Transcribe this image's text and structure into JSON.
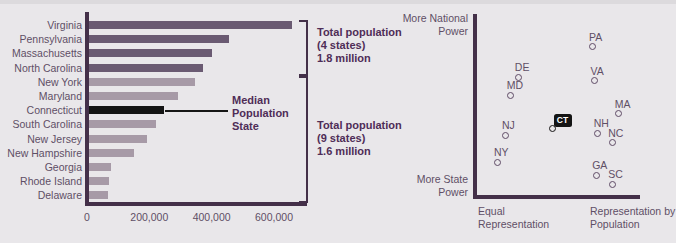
{
  "colors": {
    "background": "#e9e7ea",
    "axis": "#443049",
    "bar_dark": "#6a5a72",
    "bar_light": "#a79aa7",
    "highlight_black": "#141414",
    "label_text": "#5f4f66",
    "annotation_text": "#4f2d57"
  },
  "chart_data": [
    {
      "type": "bar",
      "title": "",
      "xlabel": "",
      "ylabel": "",
      "categories": [
        "Virginia",
        "Pennsylvania",
        "Massachusetts",
        "North Carolina",
        "New York",
        "Maryland",
        "Connecticut",
        "South Carolina",
        "New Jersey",
        "New Hampshire",
        "Georgia",
        "Rhode Island",
        "Delaware"
      ],
      "values": [
        650000,
        450000,
        395000,
        365000,
        340000,
        285000,
        240000,
        215000,
        185000,
        145000,
        70000,
        65000,
        60000
      ],
      "dark_group_count": 4,
      "highlight_category": "Connecticut",
      "xlim": [
        0,
        710000
      ],
      "x_ticks": [
        {
          "label": "0",
          "value": 0
        },
        {
          "label": "200,000",
          "value": 200000
        },
        {
          "label": "400,000",
          "value": 400000
        },
        {
          "label": "600,000",
          "value": 600000
        }
      ],
      "annotations": {
        "group_top": {
          "lines": [
            "Total population",
            "(4 states)",
            "1.8 million"
          ]
        },
        "group_bottom": {
          "lines": [
            "Total population",
            "(9 states)",
            "1.6 million"
          ]
        },
        "median": {
          "lines": [
            "Median",
            "Population",
            "State"
          ]
        }
      }
    },
    {
      "type": "scatter",
      "title": "",
      "highlight": "CT",
      "axes": {
        "y_top": [
          "More National",
          "Power"
        ],
        "y_bottom": [
          "More State",
          "Power"
        ],
        "x_left": [
          "Equal",
          "Representation"
        ],
        "x_right": [
          "Representation by",
          "Population"
        ]
      },
      "xlim": [
        0,
        1
      ],
      "ylim": [
        0,
        1
      ],
      "points": [
        {
          "label": "PA",
          "x": 0.72,
          "y": 0.82
        },
        {
          "label": "VA",
          "x": 0.73,
          "y": 0.63
        },
        {
          "label": "DE",
          "x": 0.26,
          "y": 0.65
        },
        {
          "label": "MD",
          "x": 0.21,
          "y": 0.55
        },
        {
          "label": "MA",
          "x": 0.88,
          "y": 0.45
        },
        {
          "label": "CT",
          "x": 0.47,
          "y": 0.37
        },
        {
          "label": "NH",
          "x": 0.75,
          "y": 0.34
        },
        {
          "label": "NC",
          "x": 0.84,
          "y": 0.29
        },
        {
          "label": "NJ",
          "x": 0.18,
          "y": 0.33
        },
        {
          "label": "NY",
          "x": 0.13,
          "y": 0.18
        },
        {
          "label": "GA",
          "x": 0.74,
          "y": 0.11
        },
        {
          "label": "SC",
          "x": 0.84,
          "y": 0.06
        }
      ]
    }
  ]
}
